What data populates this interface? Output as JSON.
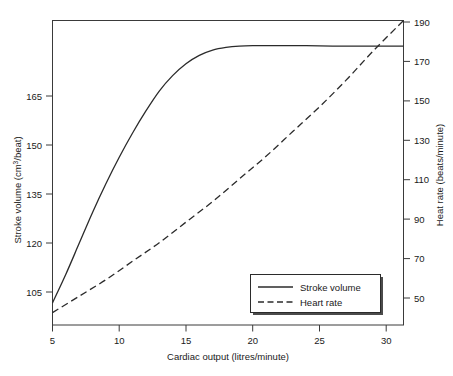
{
  "chart_data": {
    "type": "line",
    "title": "",
    "xlabel": "Cardiac output (litres/minute)",
    "ylabel": "Stroke volume (cm3/beat)",
    "ylabel_right": "Heat rate (beats/minute)",
    "xlim": [
      5,
      31.3
    ],
    "ylim": [
      100,
      169
    ],
    "ylim_right": [
      42,
      190
    ],
    "xticks": [
      5,
      10,
      15,
      20,
      25,
      30
    ],
    "xtick_labels": [
      "5",
      "10",
      "15",
      "20",
      "25",
      "30"
    ],
    "yticks": [
      105,
      120,
      135,
      150,
      165
    ],
    "ytick_labels": [
      "105",
      "120",
      "135",
      "150",
      "165"
    ],
    "yticks_right": [
      50,
      70,
      90,
      110,
      130,
      150,
      170,
      190
    ],
    "ytick_labels_right": [
      "50",
      "70",
      "90",
      "110",
      "130",
      "150",
      "170",
      "190"
    ],
    "grid": false,
    "legend_position": "lower right",
    "series": [
      {
        "name": "Stroke volume",
        "axis": "left",
        "style": "solid",
        "units": "cm3/beat",
        "x": [
          5,
          6,
          7,
          8,
          9,
          10,
          11,
          12,
          13,
          14,
          15,
          16,
          17,
          18,
          19,
          20,
          22,
          24,
          26,
          28,
          30,
          31.3
        ],
        "values": [
          105,
          111.5,
          118.5,
          125.5,
          132,
          138,
          143.5,
          148.5,
          153,
          156.5,
          159.2,
          161.1,
          162.3,
          162.9,
          163.2,
          163.3,
          163.3,
          163.3,
          163.2,
          163.2,
          163.2,
          163.2
        ]
      },
      {
        "name": "Heart rate",
        "axis": "right",
        "style": "dashed",
        "units": "beats/minute",
        "x": [
          5,
          7,
          9,
          11,
          13,
          15,
          17,
          19,
          21,
          23,
          25,
          27,
          29,
          31.3
        ],
        "values": [
          48,
          56,
          64,
          73,
          82,
          92,
          102,
          113,
          124,
          136,
          148,
          161,
          175,
          190
        ]
      }
    ],
    "legend": [
      {
        "label": "Stroke volume",
        "style": "solid"
      },
      {
        "label": "Heart rate",
        "style": "dashed"
      }
    ]
  },
  "figure": {
    "caption_sliver": ""
  }
}
